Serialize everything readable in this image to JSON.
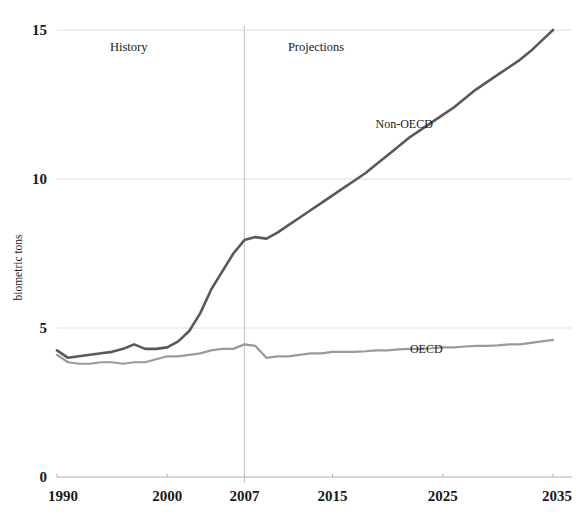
{
  "top_clipped_text": "partially cut off caption line",
  "chart_data": {
    "type": "line",
    "title": "",
    "xlabel": "",
    "ylabel": "biometric tons",
    "xlim": [
      1990,
      2035
    ],
    "ylim": [
      0,
      15
    ],
    "grid": true,
    "x_ticks": [
      "1990",
      "2000",
      "2007",
      "2015",
      "2025",
      "2035"
    ],
    "x_tick_values": [
      1990,
      2000,
      2007,
      2015,
      2025,
      2035
    ],
    "y_ticks": [
      "0",
      "5",
      "10",
      "15"
    ],
    "y_tick_values": [
      0,
      5,
      10,
      15
    ],
    "annotations": [
      {
        "text": "History",
        "x": 1996.5,
        "y": 14.3
      },
      {
        "text": "Projections",
        "x": 2013.5,
        "y": 14.3
      }
    ],
    "divider": {
      "label": "2007",
      "x": 2007
    },
    "legend_position": "inline-series-labels",
    "series": [
      {
        "name": "Non-OECD",
        "color": "#595959",
        "label_x": 2021.5,
        "label_y": 11.7,
        "x": [
          1990,
          1991,
          1992,
          1993,
          1994,
          1995,
          1996,
          1997,
          1998,
          1999,
          2000,
          2001,
          2002,
          2003,
          2004,
          2005,
          2006,
          2007,
          2008,
          2009,
          2010,
          2011,
          2012,
          2013,
          2014,
          2015,
          2016,
          2017,
          2018,
          2019,
          2020,
          2021,
          2022,
          2023,
          2024,
          2025,
          2026,
          2027,
          2028,
          2029,
          2030,
          2031,
          2032,
          2033,
          2034,
          2035
        ],
        "values": [
          4.25,
          4.0,
          4.05,
          4.1,
          4.15,
          4.2,
          4.3,
          4.45,
          4.3,
          4.3,
          4.35,
          4.55,
          4.9,
          5.5,
          6.3,
          6.9,
          7.5,
          7.95,
          8.05,
          8.0,
          8.2,
          8.45,
          8.7,
          8.95,
          9.2,
          9.45,
          9.7,
          9.95,
          10.2,
          10.5,
          10.8,
          11.1,
          11.4,
          11.65,
          11.9,
          12.15,
          12.4,
          12.7,
          13.0,
          13.25,
          13.5,
          13.75,
          14.0,
          14.3,
          14.65,
          15.0
        ]
      },
      {
        "name": "OECD",
        "color": "#9a9a9a",
        "label_x": 2023.5,
        "label_y": 4.15,
        "x": [
          1990,
          1991,
          1992,
          1993,
          1994,
          1995,
          1996,
          1997,
          1998,
          1999,
          2000,
          2001,
          2002,
          2003,
          2004,
          2005,
          2006,
          2007,
          2008,
          2009,
          2010,
          2011,
          2012,
          2013,
          2014,
          2015,
          2016,
          2017,
          2018,
          2019,
          2020,
          2021,
          2022,
          2023,
          2024,
          2025,
          2026,
          2027,
          2028,
          2029,
          2030,
          2031,
          2032,
          2033,
          2034,
          2035
        ],
        "values": [
          4.1,
          3.85,
          3.8,
          3.8,
          3.85,
          3.85,
          3.8,
          3.85,
          3.85,
          3.95,
          4.05,
          4.05,
          4.1,
          4.15,
          4.25,
          4.3,
          4.3,
          4.45,
          4.4,
          4.0,
          4.05,
          4.05,
          4.1,
          4.15,
          4.15,
          4.2,
          4.2,
          4.2,
          4.22,
          4.25,
          4.25,
          4.28,
          4.3,
          4.3,
          4.32,
          4.35,
          4.35,
          4.38,
          4.4,
          4.4,
          4.42,
          4.45,
          4.45,
          4.5,
          4.55,
          4.6
        ]
      }
    ]
  }
}
